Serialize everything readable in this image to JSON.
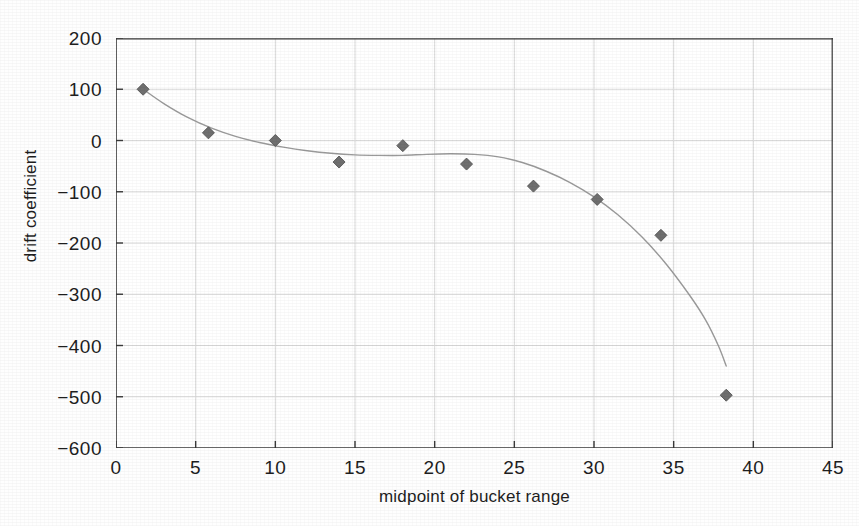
{
  "page": {
    "top_partial_text": "",
    "background_color": "#fefefe"
  },
  "chart_data": {
    "type": "scatter",
    "title": "",
    "xlabel": "midpoint of bucket range",
    "ylabel": "drift coefficient",
    "xlim": [
      0,
      45
    ],
    "ylim": [
      -600,
      200
    ],
    "xticks": [
      0,
      5,
      10,
      15,
      20,
      25,
      30,
      35,
      40,
      45
    ],
    "yticks": [
      200,
      100,
      0,
      -100,
      -200,
      -300,
      -400,
      -500,
      -600
    ],
    "xtick_labels": [
      "0",
      "5",
      "10",
      "15",
      "20",
      "25",
      "30",
      "35",
      "40",
      "45"
    ],
    "ytick_labels": [
      "200",
      "100",
      "0",
      "−100",
      "−200",
      "−300",
      "−400",
      "−500",
      "−600"
    ],
    "grid": true,
    "legend": null,
    "marker": {
      "shape": "diamond",
      "color": "#6f6f6f",
      "edge_color": "#555555",
      "size": 11
    },
    "trendline": {
      "present": true,
      "color": "#9a9a9a",
      "width": 1.4,
      "style": "smooth-fit"
    },
    "grid_color": "#d9d9d9",
    "axis_color": "#3a3a3a",
    "x": [
      1.7,
      5.8,
      10.0,
      14.0,
      18.0,
      22.0,
      26.2,
      30.2,
      34.2,
      38.3
    ],
    "y": [
      100,
      15,
      0,
      -42,
      -10,
      -46,
      -89,
      -115,
      -185,
      -497
    ],
    "fit_points": [
      [
        1.7,
        100
      ],
      [
        3.0,
        72
      ],
      [
        4.5,
        45
      ],
      [
        6.0,
        24
      ],
      [
        7.5,
        8
      ],
      [
        9.0,
        -4
      ],
      [
        10.5,
        -13
      ],
      [
        12.0,
        -20
      ],
      [
        13.5,
        -25
      ],
      [
        15.0,
        -28
      ],
      [
        16.5,
        -29
      ],
      [
        18.0,
        -29
      ],
      [
        19.5,
        -27
      ],
      [
        21.0,
        -26
      ],
      [
        22.5,
        -27
      ],
      [
        24.0,
        -32
      ],
      [
        25.5,
        -43
      ],
      [
        27.0,
        -60
      ],
      [
        28.5,
        -82
      ],
      [
        30.0,
        -110
      ],
      [
        31.5,
        -145
      ],
      [
        33.0,
        -188
      ],
      [
        34.5,
        -240
      ],
      [
        36.0,
        -302
      ],
      [
        37.0,
        -350
      ],
      [
        37.8,
        -400
      ],
      [
        38.3,
        -440
      ]
    ]
  }
}
